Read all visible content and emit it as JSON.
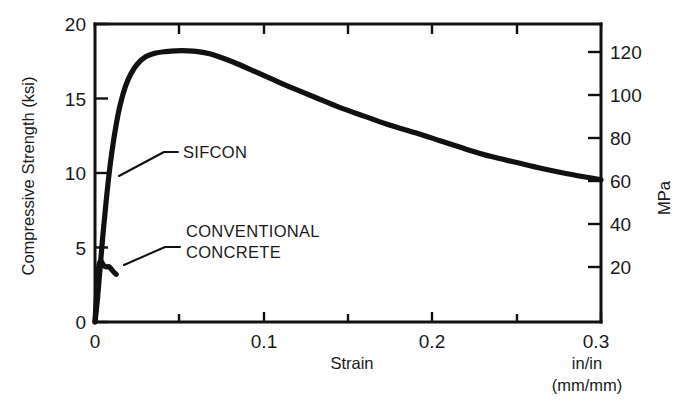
{
  "chart_data": {
    "type": "line",
    "title": "",
    "xlabel": "Strain",
    "ylabel": "Compressive Strength (ksi)",
    "y2label": "MPa",
    "xlim": [
      0,
      0.3
    ],
    "ylim": [
      0,
      20
    ],
    "y2lim": [
      0,
      137.9
    ],
    "grid": false,
    "legend_position": "inline-annotations",
    "x_unit_primary": "in/in",
    "x_unit_secondary": "(mm/mm)",
    "x_ticks": [
      {
        "value": 0,
        "label": "0"
      },
      {
        "value": 0.05,
        "label": ""
      },
      {
        "value": 0.1,
        "label": "0.1"
      },
      {
        "value": 0.15,
        "label": ""
      },
      {
        "value": 0.2,
        "label": "0.2"
      },
      {
        "value": 0.25,
        "label": ""
      },
      {
        "value": 0.3,
        "label": "0.3"
      }
    ],
    "y_ticks": [
      {
        "value": 0,
        "label": "0"
      },
      {
        "value": 5,
        "label": "5"
      },
      {
        "value": 10,
        "label": "10"
      },
      {
        "value": 15,
        "label": "15"
      },
      {
        "value": 20,
        "label": "20"
      }
    ],
    "y2_ticks": [
      {
        "value": 20,
        "label": "20"
      },
      {
        "value": 40,
        "label": "40"
      },
      {
        "value": 60,
        "label": "60"
      },
      {
        "value": 80,
        "label": "80"
      },
      {
        "value": 100,
        "label": "100"
      },
      {
        "value": 120,
        "label": "120"
      }
    ],
    "series": [
      {
        "name": "SIFCON",
        "label": "SIFCON",
        "color": "#111111",
        "points": [
          [
            0.0,
            0.0
          ],
          [
            0.0015,
            1.6
          ],
          [
            0.003,
            3.6
          ],
          [
            0.0045,
            5.6
          ],
          [
            0.006,
            7.4
          ],
          [
            0.008,
            9.6
          ],
          [
            0.01,
            11.4
          ],
          [
            0.0125,
            13.2
          ],
          [
            0.015,
            14.6
          ],
          [
            0.018,
            15.8
          ],
          [
            0.021,
            16.6
          ],
          [
            0.025,
            17.3
          ],
          [
            0.03,
            17.8
          ],
          [
            0.036,
            18.05
          ],
          [
            0.042,
            18.15
          ],
          [
            0.048,
            18.2
          ],
          [
            0.055,
            18.2
          ],
          [
            0.061,
            18.15
          ],
          [
            0.068,
            18.0
          ],
          [
            0.076,
            17.7
          ],
          [
            0.085,
            17.3
          ],
          [
            0.095,
            16.8
          ],
          [
            0.105,
            16.3
          ],
          [
            0.115,
            15.8
          ],
          [
            0.13,
            15.1
          ],
          [
            0.145,
            14.4
          ],
          [
            0.16,
            13.8
          ],
          [
            0.175,
            13.2
          ],
          [
            0.19,
            12.7
          ],
          [
            0.205,
            12.15
          ],
          [
            0.22,
            11.6
          ],
          [
            0.235,
            11.1
          ],
          [
            0.25,
            10.7
          ],
          [
            0.265,
            10.3
          ],
          [
            0.28,
            9.95
          ],
          [
            0.3,
            9.55
          ]
        ]
      },
      {
        "name": "CONVENTIONAL CONCRETE",
        "label_line1": "CONVENTIONAL",
        "label_line2": "CONCRETE",
        "color": "#111111",
        "points": [
          [
            0.0,
            0.0
          ],
          [
            0.0006,
            1.2
          ],
          [
            0.0012,
            2.4
          ],
          [
            0.0018,
            3.3
          ],
          [
            0.0024,
            3.85
          ],
          [
            0.003,
            4.05
          ],
          [
            0.0038,
            4.05
          ],
          [
            0.0046,
            3.9
          ],
          [
            0.0056,
            3.75
          ],
          [
            0.0068,
            3.7
          ],
          [
            0.008,
            3.72
          ],
          [
            0.0092,
            3.62
          ],
          [
            0.0104,
            3.45
          ],
          [
            0.0116,
            3.3
          ],
          [
            0.0126,
            3.2
          ]
        ]
      }
    ],
    "annotations": [
      {
        "name": "sifcon-callout",
        "text": "SIFCON"
      },
      {
        "name": "conventional-concrete-callout",
        "text": "CONVENTIONAL CONCRETE"
      }
    ]
  }
}
